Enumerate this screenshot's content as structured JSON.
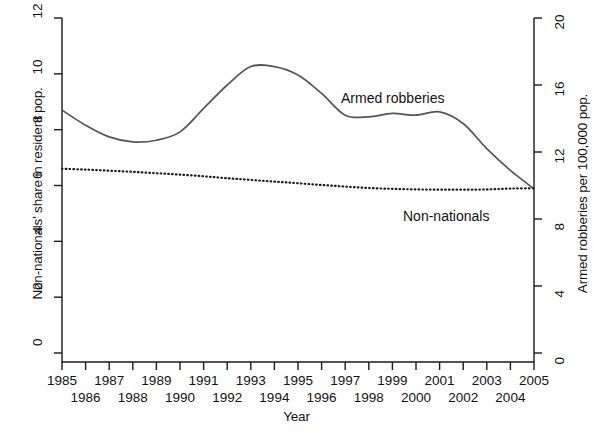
{
  "chart_data": {
    "type": "line",
    "title": "",
    "xlabel": "Year",
    "ylabel_left": "Non-nationals' share in resident pop.",
    "ylabel_right": "Armed robberies per 100,000 pop.",
    "x": [
      1985,
      1986,
      1987,
      1988,
      1989,
      1990,
      1991,
      1992,
      1993,
      1994,
      1995,
      1996,
      1997,
      1998,
      1999,
      2000,
      2001,
      2002,
      2003,
      2004,
      2005
    ],
    "xtick_labels_top": [
      "1985",
      "1987",
      "1989",
      "1991",
      "1993",
      "1995",
      "1997",
      "1999",
      "2001",
      "2003",
      "2005"
    ],
    "xtick_labels_bottom": [
      "1986",
      "1988",
      "1990",
      "1992",
      "1994",
      "1996",
      "1998",
      "2000",
      "2002",
      "2004"
    ],
    "xlim": [
      1985,
      2005
    ],
    "ylim_left": [
      0,
      12
    ],
    "ytick_labels_left": [
      "0",
      "2",
      "4",
      "6",
      "8",
      "10",
      "12"
    ],
    "ytick_values_left": [
      0,
      2,
      4,
      6,
      8,
      10,
      12
    ],
    "ylim_right": [
      0,
      20
    ],
    "ytick_labels_right": [
      "0",
      "4",
      "8",
      "12",
      "16",
      "20"
    ],
    "ytick_values_right": [
      0,
      4,
      8,
      12,
      16,
      20
    ],
    "grid": false,
    "legend_position": "inline-annotations",
    "series": [
      {
        "name": "Armed robberies",
        "axis": "right",
        "style": "solid",
        "color": "#555555",
        "values_right_axis": [
          14.5,
          13.6,
          12.9,
          12.6,
          12.7,
          13.2,
          14.6,
          16.0,
          17.1,
          17.1,
          16.6,
          15.5,
          14.2,
          14.1,
          14.3,
          14.2,
          14.4,
          13.7,
          12.2,
          10.9,
          9.8
        ],
        "values_left_axis_equivalent": [
          8.7,
          8.15,
          7.75,
          7.6,
          7.65,
          7.9,
          8.75,
          9.6,
          10.25,
          10.25,
          9.95,
          9.3,
          8.5,
          8.45,
          8.6,
          8.55,
          8.65,
          8.2,
          7.3,
          6.55,
          5.9
        ]
      },
      {
        "name": "Non-nationals",
        "axis": "left",
        "style": "dotted",
        "color": "#1a1a1a",
        "values": [
          6.6,
          6.57,
          6.53,
          6.49,
          6.44,
          6.39,
          6.33,
          6.26,
          6.2,
          6.14,
          6.08,
          6.02,
          5.96,
          5.91,
          5.88,
          5.86,
          5.85,
          5.85,
          5.86,
          5.89,
          5.9
        ]
      }
    ],
    "annotations": [
      {
        "text": "Armed robberies",
        "x": 1996.6,
        "y_px": 90
      },
      {
        "text": "Non-nationals",
        "x": 1999.4,
        "y_px": 208
      }
    ]
  }
}
